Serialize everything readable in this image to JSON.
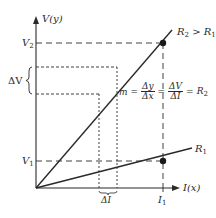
{
  "diagram": {
    "type": "V-I characteristic (Ohm's law slope)",
    "axes": {
      "y_label": "V(y)",
      "x_label": "I(x)"
    },
    "y_ticks": [
      {
        "name": "V2",
        "text": "V",
        "sub": "2"
      },
      {
        "name": "V1",
        "text": "V",
        "sub": "1"
      }
    ],
    "x_ticks": [
      {
        "name": "I1",
        "text": "I",
        "sub": "1"
      }
    ],
    "lines": [
      {
        "name": "R2",
        "label": "R",
        "sub": "2",
        "suffix": " > R",
        "suffix_sub": "1"
      },
      {
        "name": "R1",
        "label": "R",
        "sub": "1"
      }
    ],
    "delta_v_label": "ΔV",
    "delta_i_label": "ΔI",
    "equation": {
      "lhs": "m =",
      "frac1": {
        "num": "Δy",
        "den": "Δx"
      },
      "eq1": "=",
      "frac2": {
        "num": "ΔV",
        "den": "ΔI"
      },
      "eq2": "=",
      "rhs": "R",
      "rhs_sub": "2"
    },
    "colors": {
      "ink": "#2a2a2a",
      "background": "#ffffff"
    }
  }
}
